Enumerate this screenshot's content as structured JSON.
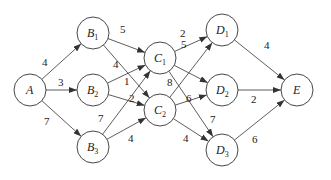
{
  "graph": {
    "nodes": [
      {
        "id": "A",
        "label": "A",
        "sub": "",
        "x": 30,
        "y": 90
      },
      {
        "id": "B1",
        "label": "B",
        "sub": "1",
        "x": 93,
        "y": 33
      },
      {
        "id": "B2",
        "label": "B",
        "sub": "2",
        "x": 93,
        "y": 90
      },
      {
        "id": "B3",
        "label": "B",
        "sub": "3",
        "x": 93,
        "y": 147
      },
      {
        "id": "C1",
        "label": "C",
        "sub": "1",
        "x": 160,
        "y": 58
      },
      {
        "id": "C2",
        "label": "C",
        "sub": "2",
        "x": 160,
        "y": 110
      },
      {
        "id": "D1",
        "label": "D",
        "sub": "1",
        "x": 222,
        "y": 30
      },
      {
        "id": "D2",
        "label": "D",
        "sub": "2",
        "x": 222,
        "y": 90
      },
      {
        "id": "D3",
        "label": "D",
        "sub": "3",
        "x": 222,
        "y": 150
      },
      {
        "id": "E",
        "label": "E",
        "sub": "",
        "x": 297,
        "y": 90
      }
    ],
    "edges": [
      {
        "from": "A",
        "to": "B1",
        "w": "4",
        "lx": 42,
        "ly": 66
      },
      {
        "from": "A",
        "to": "B2",
        "w": "3",
        "lx": 58,
        "ly": 86
      },
      {
        "from": "A",
        "to": "B3",
        "w": "7",
        "lx": 44,
        "ly": 125
      },
      {
        "from": "B1",
        "to": "C1",
        "w": "5",
        "lx": 120,
        "ly": 33
      },
      {
        "from": "B1",
        "to": "C2",
        "w": "4",
        "lx": 113,
        "ly": 68
      },
      {
        "from": "B2",
        "to": "C1",
        "w": "1",
        "lx": 124,
        "ly": 85
      },
      {
        "from": "B2",
        "to": "C2",
        "w": "2",
        "lx": 129,
        "ly": 102
      },
      {
        "from": "B3",
        "to": "C1",
        "w": "7",
        "lx": 98,
        "ly": 122
      },
      {
        "from": "B3",
        "to": "C2",
        "w": "4",
        "lx": 128,
        "ly": 142
      },
      {
        "from": "C1",
        "to": "D1",
        "w": "2",
        "lx": 180,
        "ly": 37
      },
      {
        "from": "C1",
        "to": "D2",
        "w": "5",
        "lx": 181,
        "ly": 48
      },
      {
        "from": "C1",
        "to": "D3",
        "w": "7",
        "lx": 210,
        "ly": 123
      },
      {
        "from": "C2",
        "to": "D1",
        "w": "8",
        "lx": 167,
        "ly": 86
      },
      {
        "from": "C2",
        "to": "D2",
        "w": "6",
        "lx": 186,
        "ly": 102
      },
      {
        "from": "C2",
        "to": "D3",
        "w": "4",
        "lx": 183,
        "ly": 142
      },
      {
        "from": "D1",
        "to": "E",
        "w": "4",
        "lx": 264,
        "ly": 49
      },
      {
        "from": "D2",
        "to": "E",
        "w": "2",
        "lx": 251,
        "ly": 103
      },
      {
        "from": "D3",
        "to": "E",
        "w": "6",
        "lx": 252,
        "ly": 143
      }
    ]
  }
}
